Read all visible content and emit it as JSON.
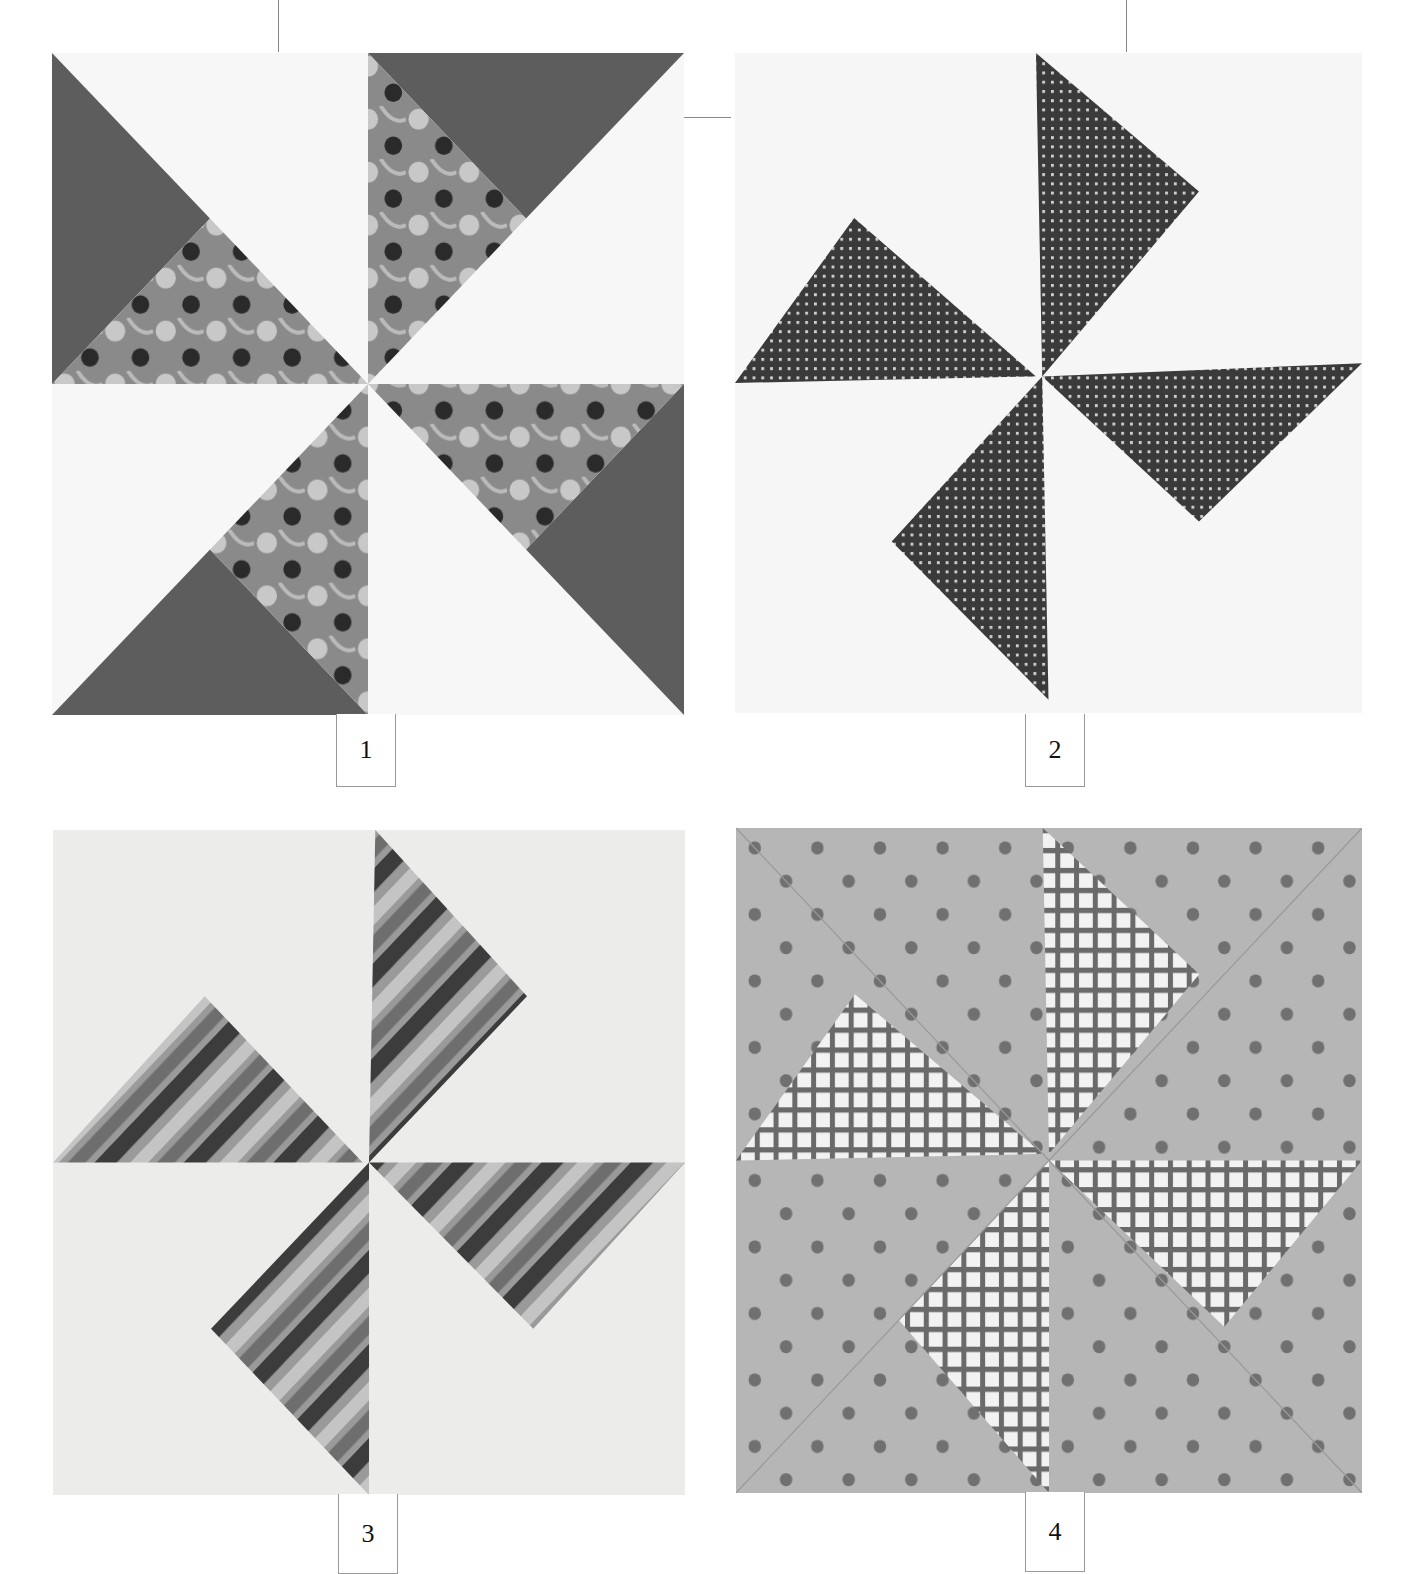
{
  "page": {
    "header_text_fragment": "p",
    "figures": [
      {
        "number": "1",
        "description": "Pinwheel block with solid dark gray and floral print triangles on white"
      },
      {
        "number": "2",
        "description": "Pinwheel block with dark check/gingham triangles on white"
      },
      {
        "number": "3",
        "description": "Pinwheel block with striped triangles on light background"
      },
      {
        "number": "4",
        "description": "Pinwheel block with plaid triangles on gray polka-dot background"
      }
    ]
  },
  "colors": {
    "solid_dark": "#5a5a5a",
    "white_fabric": "#f6f6f6",
    "light_fabric": "#e8e8e6",
    "dot_bg": "#b4b4b4",
    "dot": "#6e6e6e",
    "check": "#3a3a3a"
  }
}
